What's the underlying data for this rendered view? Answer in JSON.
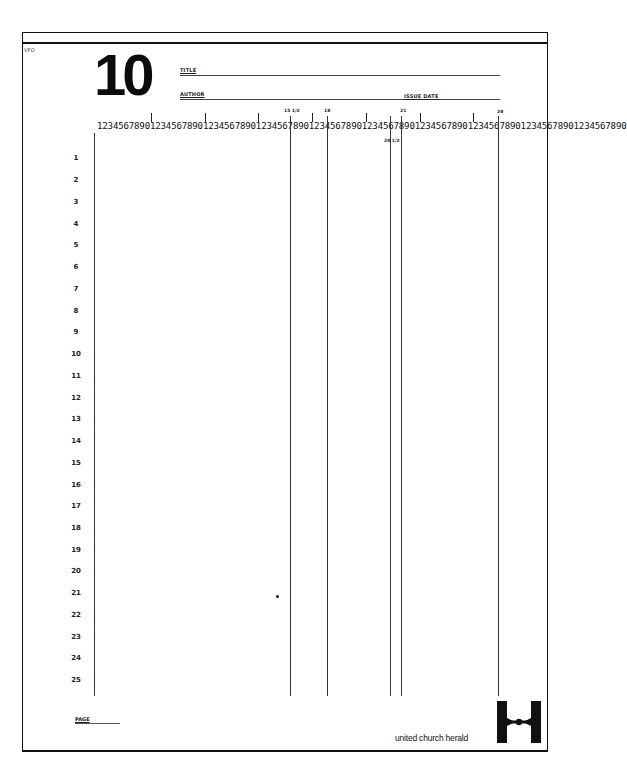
{
  "form": {
    "code": "VPO",
    "page_number": "10",
    "title_label": "TITLE",
    "author_label": "AUTHOR",
    "issue_date_label": "ISSUE DATE",
    "page_label": "PAGE",
    "brand": "united church herald"
  },
  "ruler": {
    "text": "1234567890123456789012345678901234567890123456789012345678901234567890123456789012345678901234567890",
    "markers": [
      {
        "label": "15 1/2",
        "position": "above"
      },
      {
        "label": "18",
        "position": "above"
      },
      {
        "label": "20 1/2",
        "position": "below"
      },
      {
        "label": "21",
        "position": "above"
      },
      {
        "label": "28",
        "position": "above"
      }
    ]
  },
  "rows": [
    "1",
    "2",
    "3",
    "4",
    "5",
    "6",
    "7",
    "8",
    "9",
    "10",
    "11",
    "12",
    "13",
    "14",
    "15",
    "16",
    "17",
    "18",
    "19",
    "20",
    "21",
    "22",
    "23",
    "24",
    "25"
  ],
  "colors": {
    "ink": "#111111",
    "paper": "#ffffff"
  }
}
